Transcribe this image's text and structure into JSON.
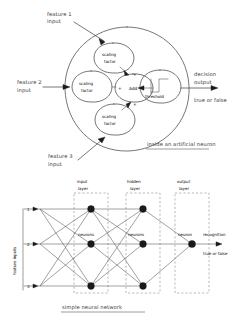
{
  "figure": {
    "title_top": "inside an artificial neuron",
    "title_bottom": "simple neural network"
  },
  "neuron_diagram": {
    "name": "inside-an-artificial-neuron",
    "inputs": [
      {
        "label_line1": "feature 1",
        "label_line2": "input"
      },
      {
        "label_line1": "feature 2",
        "label_line2": "input"
      },
      {
        "label_line1": "feature 3",
        "label_line2": "input"
      }
    ],
    "scaling_nodes": [
      {
        "line1": "scaling",
        "line2": "factor"
      },
      {
        "line1": "scaling",
        "line2": "factor"
      },
      {
        "line1": "scaling",
        "line2": "factor"
      }
    ],
    "sum_node": {
      "label": "add",
      "plus_top": "+",
      "plus_left": "+",
      "plus_bottom": "+"
    },
    "threshold_node": {
      "label": "threshold",
      "glyph": "step-function"
    },
    "output": {
      "line1": "decision",
      "line2": "output",
      "line3": "true or false"
    },
    "caption": "inside an artificial neuron"
  },
  "network_diagram": {
    "name": "simple-neural-network",
    "axis_label": "feature inputs",
    "input_numbers": [
      "1",
      "2",
      "3"
    ],
    "layers": [
      {
        "key": "input",
        "line1": "input",
        "line2": "layer",
        "node_label": "neurons",
        "node_count": 3
      },
      {
        "key": "hidden",
        "line1": "hidden",
        "line2": "layer",
        "node_label": "neurons",
        "node_count": 3
      },
      {
        "key": "output",
        "line1": "output",
        "line2": "layer",
        "node_label": "neuron",
        "node_count": 1
      }
    ],
    "output": {
      "line1": "recognition",
      "line2": "true or false"
    },
    "caption": "simple neural network"
  },
  "colors": {
    "ink": "#3a3a3a",
    "stroke": "#4a4a4a",
    "dashed": "#8a8a8a",
    "node": "#1a1a1a",
    "background": "#ffffff"
  }
}
